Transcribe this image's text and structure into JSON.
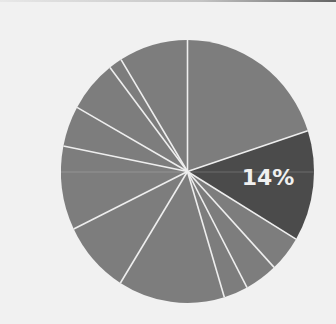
{
  "chart_data": {
    "type": "pie",
    "title": "",
    "start_angle_deg": 0,
    "direction": "clockwise",
    "legend": "none",
    "slices": [
      {
        "label": "",
        "value": 20.0,
        "color": "#7d7d7d",
        "show_label": false
      },
      {
        "label": "14%",
        "value": 13.6,
        "color": "#4b4b4b",
        "show_label": true
      },
      {
        "label": "",
        "value": 4.4,
        "color": "#7d7d7d",
        "show_label": false
      },
      {
        "label": "",
        "value": 4.2,
        "color": "#7d7d7d",
        "show_label": false
      },
      {
        "label": "",
        "value": 3.1,
        "color": "#7d7d7d",
        "show_label": false
      },
      {
        "label": "",
        "value": 13.6,
        "color": "#7d7d7d",
        "show_label": false
      },
      {
        "label": "",
        "value": 8.9,
        "color": "#7d7d7d",
        "show_label": false
      },
      {
        "label": "",
        "value": 10.3,
        "color": "#7d7d7d",
        "show_label": false
      },
      {
        "label": "",
        "value": 5.0,
        "color": "#7d7d7d",
        "show_label": false
      },
      {
        "label": "",
        "value": 6.4,
        "color": "#7d7d7d",
        "show_label": false
      },
      {
        "label": "",
        "value": 1.7,
        "color": "#7d7d7d",
        "show_label": false
      },
      {
        "label": "",
        "value": 8.8,
        "color": "#7d7d7d",
        "show_label": false
      }
    ],
    "highlighted_label": "14%",
    "separator_color": "#eeeeee",
    "background": "#f1f1f1"
  }
}
